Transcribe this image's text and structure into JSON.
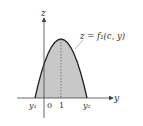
{
  "diagram": {
    "axis_labels": {
      "vertical": "z",
      "horizontal": "y"
    },
    "curve_label": "z = f₁(c, y)",
    "tick_labels": {
      "left_root": "y₁",
      "origin": "0",
      "peak": "1",
      "right_root": "y₂"
    },
    "colors": {
      "fill": "#c8c8c8",
      "curve": "#222222",
      "axis": "#444444"
    }
  }
}
